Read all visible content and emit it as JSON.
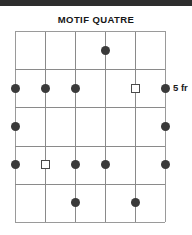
{
  "document": {
    "top_band_color": "#2e2e2e"
  },
  "title": "MOTIF QUATRE",
  "diagram": {
    "type": "chord-diagram",
    "strings": 6,
    "frets": 5,
    "grid_color": "#8a8a8a",
    "dot_color": "#3a3a3a",
    "fret_label": "5 fr",
    "fret_label_row": 2,
    "markers": [
      {
        "string": 4,
        "fret": 1,
        "shape": "dot"
      },
      {
        "string": 1,
        "fret": 2,
        "shape": "dot"
      },
      {
        "string": 2,
        "fret": 2,
        "shape": "dot"
      },
      {
        "string": 3,
        "fret": 2,
        "shape": "dot"
      },
      {
        "string": 5,
        "fret": 2,
        "shape": "square"
      },
      {
        "string": 6,
        "fret": 2,
        "shape": "dot"
      },
      {
        "string": 1,
        "fret": 3,
        "shape": "dot"
      },
      {
        "string": 6,
        "fret": 3,
        "shape": "dot"
      },
      {
        "string": 1,
        "fret": 4,
        "shape": "dot"
      },
      {
        "string": 2,
        "fret": 4,
        "shape": "square"
      },
      {
        "string": 3,
        "fret": 4,
        "shape": "dot"
      },
      {
        "string": 4,
        "fret": 4,
        "shape": "dot"
      },
      {
        "string": 6,
        "fret": 4,
        "shape": "dot"
      },
      {
        "string": 3,
        "fret": 5,
        "shape": "dot"
      },
      {
        "string": 5,
        "fret": 5,
        "shape": "dot"
      }
    ]
  }
}
